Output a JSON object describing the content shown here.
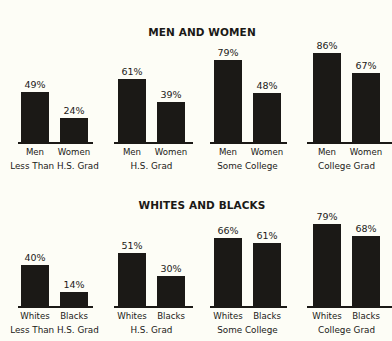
{
  "chart_data": [
    {
      "type": "bar",
      "title": "MEN AND WOMEN",
      "categories": [
        "Less Than H.S. Grad",
        "H.S. Grad",
        "Some College",
        "College Grad"
      ],
      "series": [
        {
          "name": "Men",
          "values": [
            49,
            61,
            79,
            86
          ]
        },
        {
          "name": "Women",
          "values": [
            24,
            39,
            48,
            67
          ]
        }
      ],
      "value_labels": {
        "Men": [
          "49%",
          "61%",
          "79%",
          "86%"
        ],
        "Women": [
          "24%",
          "39%",
          "48%",
          "67%"
        ]
      },
      "xlabel": "",
      "ylabel": "",
      "ylim": [
        0,
        100
      ],
      "grid": false,
      "legend": "none (series names shown under each bar)"
    },
    {
      "type": "bar",
      "title": "WHITES AND BLACKS",
      "categories": [
        "Less Than H.S. Grad",
        "H.S. Grad",
        "Some College",
        "College Grad"
      ],
      "series": [
        {
          "name": "Whites",
          "values": [
            40,
            51,
            66,
            79
          ]
        },
        {
          "name": "Blacks",
          "values": [
            14,
            30,
            61,
            68
          ]
        }
      ],
      "value_labels": {
        "Whites": [
          "40%",
          "51%",
          "66%",
          "79%"
        ],
        "Blacks": [
          "14%",
          "30%",
          "61%",
          "68%"
        ]
      },
      "xlabel": "",
      "ylabel": "",
      "ylim": [
        0,
        100
      ],
      "grid": false,
      "legend": "none (series names shown under each bar)"
    }
  ],
  "panels": [
    {
      "title": "MEN AND WOMEN",
      "groups": [
        {
          "label": "Less Than H.S. Grad",
          "a_name": "Men",
          "a_val": "49%",
          "b_name": "Women",
          "b_val": "24%"
        },
        {
          "label": "H.S. Grad",
          "a_name": "Men",
          "a_val": "61%",
          "b_name": "Women",
          "b_val": "39%"
        },
        {
          "label": "Some College",
          "a_name": "Men",
          "a_val": "79%",
          "b_name": "Women",
          "b_val": "48%"
        },
        {
          "label": "College Grad",
          "a_name": "Men",
          "a_val": "86%",
          "b_name": "Women",
          "b_val": "67%"
        }
      ]
    },
    {
      "title": "WHITES AND BLACKS",
      "groups": [
        {
          "label": "Less Than H.S. Grad",
          "a_name": "Whites",
          "a_val": "40%",
          "b_name": "Blacks",
          "b_val": "14%"
        },
        {
          "label": "H.S. Grad",
          "a_name": "Whites",
          "a_val": "51%",
          "b_name": "Blacks",
          "b_val": "30%"
        },
        {
          "label": "Some College",
          "a_name": "Whites",
          "a_val": "66%",
          "b_name": "Blacks",
          "b_val": "61%"
        },
        {
          "label": "College Grad",
          "a_name": "Whites",
          "a_val": "79%",
          "b_name": "Blacks",
          "b_val": "68%"
        }
      ]
    }
  ],
  "colors": {
    "bar": "#1b1916",
    "background": "#fdfdf6",
    "text": "#1b1916"
  }
}
